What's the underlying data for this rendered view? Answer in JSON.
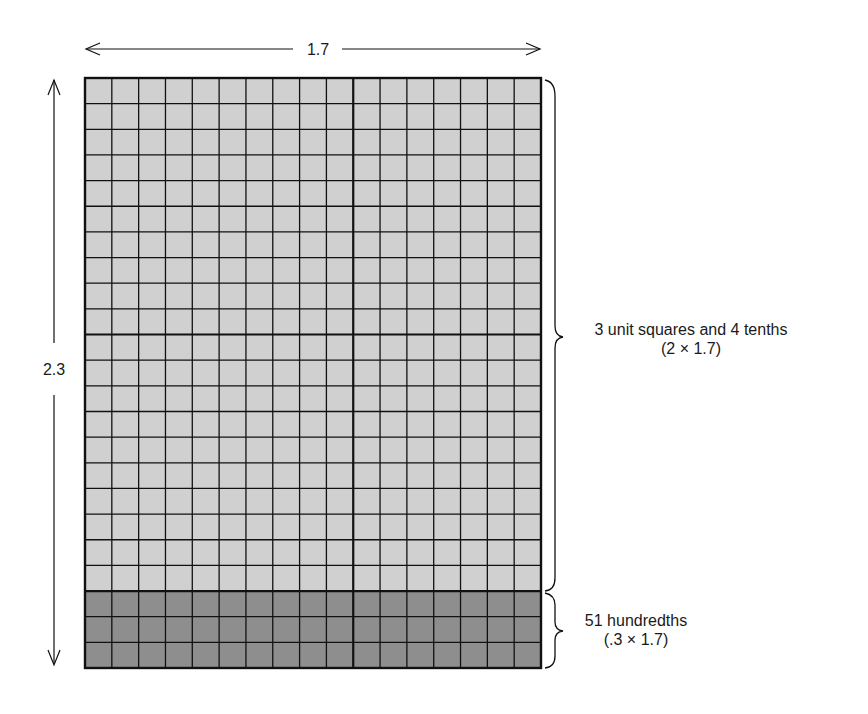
{
  "diagram": {
    "width_label": "1.7",
    "height_label": "2.3",
    "grid": {
      "columns": 17,
      "rows": 23,
      "unit_cells": 10,
      "shaded_bottom_rows": 3,
      "x": 85,
      "y": 78,
      "w": 456,
      "h": 590
    },
    "colors": {
      "light_fill": "#d0d0d0",
      "dark_fill": "#8e8e8e",
      "line": "#111111"
    },
    "brace_upper": {
      "line1": "3 unit squares and 4 tenths",
      "line2": "(2 × 1.7)"
    },
    "brace_lower": {
      "line1": "51 hundredths",
      "line2": "(.3 × 1.7)"
    }
  }
}
